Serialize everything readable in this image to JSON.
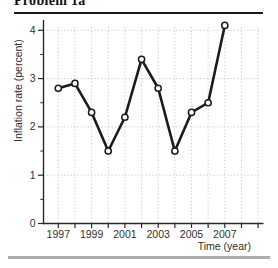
{
  "page": {
    "title": "Problem 1a"
  },
  "chart_data": {
    "type": "line",
    "title": "Problem 1a",
    "xlabel": "Time (year)",
    "ylabel": "Inflation rate (percent)",
    "x": [
      1997,
      1998,
      1999,
      2000,
      2001,
      2002,
      2003,
      2004,
      2005,
      2006,
      2007
    ],
    "series": [
      {
        "name": "Inflation rate",
        "values": [
          2.8,
          2.9,
          2.3,
          1.5,
          2.2,
          3.4,
          2.8,
          1.5,
          2.3,
          2.5,
          4.1
        ]
      }
    ],
    "x_tick_years": [
      1997,
      1998,
      1999,
      2000,
      2001,
      2002,
      2003,
      2004,
      2005,
      2006,
      2007,
      2008,
      2009
    ],
    "x_label_years": [
      "1997",
      "1999",
      "2001",
      "2003",
      "2005",
      "2007"
    ],
    "y_ticks": [
      "0",
      "1",
      "2",
      "3",
      "4"
    ],
    "y_minor_ticks": [
      0.5,
      1.5,
      2.5,
      3.5
    ],
    "xlim": [
      1996.1,
      2009.3
    ],
    "ylim": [
      0,
      4.2
    ],
    "grid": true,
    "legend": false,
    "marker": "circle-open",
    "colors": {
      "line": "#1b1b1b",
      "marker_fill": "#ffffff",
      "grid": "#c8c8c8",
      "axis": "#2a2a2a",
      "text": "#333333",
      "top_rule": "#1a1a1a",
      "bottom_bar": "#aeaeae"
    }
  }
}
